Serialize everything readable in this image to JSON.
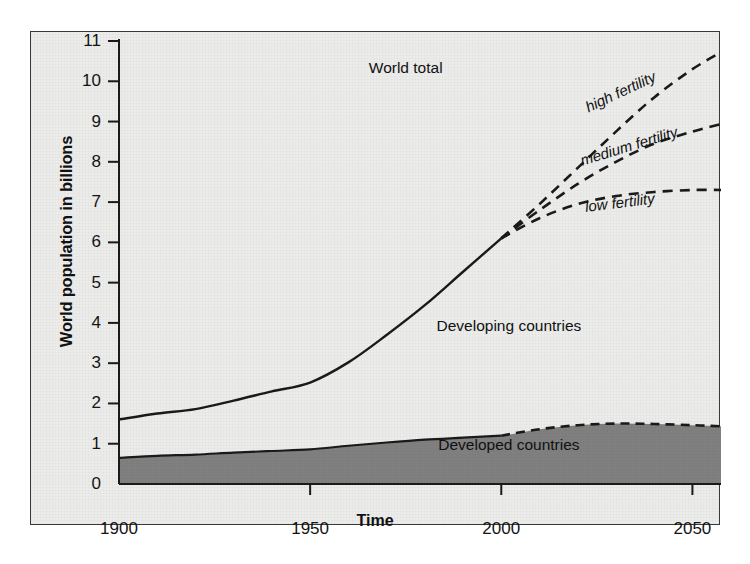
{
  "chart_data": {
    "type": "area",
    "title": "",
    "xlabel": "Time",
    "ylabel": "World population in billions",
    "xlim": [
      1900,
      2058
    ],
    "ylim": [
      0,
      11
    ],
    "xticks": [
      "1900",
      "1950",
      "2000",
      "2050"
    ],
    "xtick_values": [
      1900,
      1950,
      2000,
      2050
    ],
    "yticks": [
      "0",
      "1",
      "2",
      "3",
      "4",
      "5",
      "6",
      "7",
      "8",
      "9",
      "10",
      "11"
    ],
    "ytick_values": [
      0,
      1,
      2,
      3,
      4,
      5,
      6,
      7,
      8,
      9,
      10,
      11
    ],
    "grid": false,
    "legend": "in-plot annotations",
    "annotations": [
      {
        "name": "world-total",
        "text": "World total",
        "x": 1975,
        "y": 10.3
      },
      {
        "name": "developing-countries",
        "text": "Developing countries",
        "x": 2002,
        "y": 3.9
      },
      {
        "name": "developed-countries",
        "text": "Developed countries",
        "x": 2002,
        "y": 0.95
      },
      {
        "name": "high-fertility",
        "text": "high fertility",
        "x": 2032,
        "y": 9.3
      },
      {
        "name": "medium-fertility",
        "text": "medium fertility",
        "x": 2034,
        "y": 8.0
      },
      {
        "name": "low-fertility",
        "text": "low fertility",
        "x": 2031,
        "y": 6.85
      }
    ],
    "series": [
      {
        "name": "World total",
        "style": "solid",
        "x": [
          1900,
          1910,
          1920,
          1930,
          1940,
          1950,
          1960,
          1970,
          1980,
          1990,
          2000
        ],
        "values": [
          1.6,
          1.75,
          1.86,
          2.07,
          2.3,
          2.52,
          3.02,
          3.7,
          4.44,
          5.27,
          6.1
        ]
      },
      {
        "name": "high fertility",
        "style": "dashed",
        "x": [
          2000,
          2010,
          2020,
          2030,
          2040,
          2050,
          2058
        ],
        "values": [
          6.1,
          6.95,
          7.85,
          8.75,
          9.6,
          10.3,
          10.75
        ]
      },
      {
        "name": "medium fertility",
        "style": "dashed",
        "x": [
          2000,
          2010,
          2020,
          2030,
          2040,
          2050,
          2058
        ],
        "values": [
          6.1,
          6.8,
          7.45,
          8.0,
          8.45,
          8.75,
          8.95
        ]
      },
      {
        "name": "low fertility",
        "style": "dashed",
        "x": [
          2000,
          2010,
          2020,
          2030,
          2040,
          2050,
          2058
        ],
        "values": [
          6.1,
          6.6,
          6.95,
          7.15,
          7.25,
          7.3,
          7.3
        ]
      },
      {
        "name": "Developed countries",
        "style": "solid-then-dashed",
        "fill": "#808080",
        "x": [
          1900,
          1910,
          1920,
          1930,
          1940,
          1950,
          1960,
          1970,
          1980,
          1990,
          2000,
          2010,
          2020,
          2030,
          2040,
          2050,
          2058
        ],
        "values": [
          0.65,
          0.7,
          0.73,
          0.78,
          0.82,
          0.86,
          0.95,
          1.03,
          1.1,
          1.15,
          1.2,
          1.36,
          1.46,
          1.5,
          1.49,
          1.46,
          1.43
        ]
      }
    ],
    "colors": {
      "plot_background": "#ececeb",
      "developed_fill": "#808080",
      "developing_fill": "#ececeb",
      "line": "#1a1a1a",
      "border": "#3a3a3a",
      "page_background": "#ffffff"
    }
  }
}
